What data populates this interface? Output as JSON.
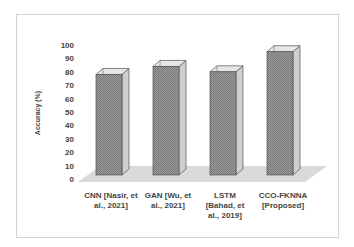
{
  "chart_data": {
    "type": "bar",
    "style": "3d-column",
    "title": "",
    "xlabel": "",
    "ylabel": "Accuracy (%)",
    "ylim": [
      0,
      100
    ],
    "yticks": [
      0,
      10,
      20,
      30,
      40,
      50,
      60,
      70,
      80,
      90,
      100
    ],
    "grid": false,
    "legend": null,
    "categories": [
      "CNN [Nasir, et al., 2021]",
      "GAN [Wu, et al., 2021]",
      "LSTM [Bahad, et al., 2019]",
      "CCO-FKNNA [Proposed]"
    ],
    "category_lines": [
      [
        "CNN [Nasir, et",
        "al., 2021]"
      ],
      [
        "GAN [Wu, et",
        "al., 2021]"
      ],
      [
        "LSTM",
        "[Bahad, et",
        "al., 2019]"
      ],
      [
        "CCO-FKNNA",
        "[Proposed]"
      ]
    ],
    "values": [
      78,
      84,
      80,
      95
    ],
    "colors": {
      "front": "#8a8a8a",
      "side": "#cfcfcf",
      "top": "#e6e6e6",
      "edge": "#555555",
      "floor": "#dadada"
    }
  }
}
